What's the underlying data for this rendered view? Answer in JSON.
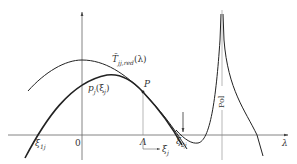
{
  "diagram": {
    "labels": {
      "curve_upper": "T̄",
      "curve_upper_sub": "jj,red",
      "curve_upper_arg": "(λ)",
      "curve_lower": "p",
      "curve_lower_sub": "j",
      "curve_lower_arg": "(ξ",
      "curve_lower_arg_sub": "j",
      "curve_lower_close": ")",
      "point_p": "P",
      "origin": "0",
      "point_a": "Λ",
      "xi_left": "ξ",
      "xi_left_sub": "1j",
      "xi_right": "ξ",
      "xi_right_sub": "2j",
      "xi_j": "ξ",
      "xi_j_sub": "j",
      "pole": "Pol",
      "x_axis": "λ"
    },
    "colors": {
      "stroke": "#222222",
      "axis": "#555555",
      "background": "#ffffff"
    }
  }
}
